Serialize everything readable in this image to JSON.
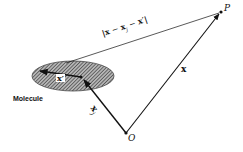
{
  "diagram": {
    "points": {
      "P": {
        "label": "P"
      },
      "O": {
        "label": "O"
      }
    },
    "vectors": {
      "x": {
        "label": "x",
        "from": "O",
        "to": "P"
      },
      "x_j": {
        "label": "x",
        "subscript": "j",
        "from": "O",
        "to": "molecule-center"
      },
      "x_prime": {
        "label": "x′",
        "from": "molecule-center",
        "to": "charge-point"
      }
    },
    "distance_label": {
      "text_parts": [
        "|",
        "x",
        " − ",
        "x",
        "j",
        " − ",
        "x′",
        "|"
      ]
    },
    "molecule": {
      "label": "Molecule"
    },
    "colors": {
      "line": "#111111",
      "ellipse_fill": "#8a8a8a",
      "background": "#ffffff"
    }
  }
}
